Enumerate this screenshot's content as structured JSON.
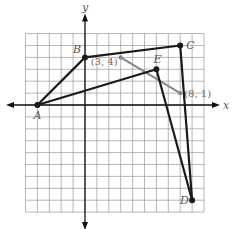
{
  "diagram": {
    "type": "coordinate-plane",
    "axes": {
      "x_label": "x",
      "y_label": "y"
    },
    "grid": {
      "x_min": -5,
      "x_max": 10,
      "y_min": -9,
      "y_max": 6,
      "step": 1
    },
    "points": [
      {
        "name": "A",
        "x": -4,
        "y": 0
      },
      {
        "name": "B",
        "x": 0,
        "y": 4
      },
      {
        "name": "C",
        "x": 8,
        "y": 5
      },
      {
        "name": "D",
        "x": 9,
        "y": -8
      },
      {
        "name": "E",
        "x": 6,
        "y": 3
      }
    ],
    "polygon_segments": [
      [
        "A",
        "B"
      ],
      [
        "B",
        "C"
      ],
      [
        "C",
        "D"
      ],
      [
        "D",
        "E"
      ],
      [
        "E",
        "A"
      ]
    ],
    "highlight_segment": {
      "from": {
        "x": 3,
        "y": 4,
        "label": "(3, 4)"
      },
      "to": {
        "x": 8,
        "y": 1,
        "label": "(8, 1)"
      },
      "color": "#888888"
    },
    "colors": {
      "polygon": "#1a1a1a",
      "grid": "#999999",
      "axes": "#111111"
    }
  }
}
